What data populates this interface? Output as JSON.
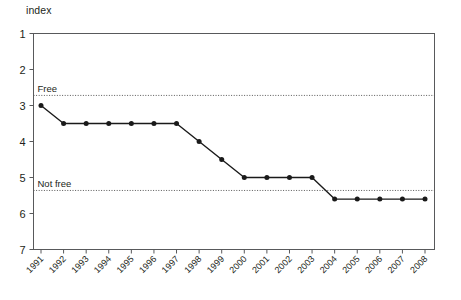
{
  "figure": {
    "axis_caption": "index"
  },
  "chart_data": {
    "type": "line",
    "title": "",
    "subtitle": "",
    "xlabel": "",
    "ylabel": "index",
    "grid": false,
    "legend_position": "none",
    "y_inverted": true,
    "ylim": [
      1,
      7
    ],
    "yticks": [
      1,
      2,
      3,
      4,
      5,
      6,
      7
    ],
    "ytick_labels": [
      "1",
      "2",
      "3",
      "4",
      "5",
      "6",
      "7"
    ],
    "x": [
      1991,
      1992,
      1993,
      1994,
      1995,
      1996,
      1997,
      1998,
      1999,
      2000,
      2001,
      2002,
      2003,
      2004,
      2005,
      2006,
      2007,
      2008
    ],
    "xtick_labels": [
      "1991",
      "1992",
      "1993",
      "1994",
      "1995",
      "1996",
      "1997",
      "1998",
      "1999",
      "2000",
      "2001",
      "2002",
      "2003",
      "2004",
      "2005",
      "2006",
      "2007",
      "2008"
    ],
    "series": [
      {
        "name": "index",
        "color": "#1a1a1a",
        "marker": "circle",
        "values": [
          3.0,
          3.5,
          3.5,
          3.5,
          3.5,
          3.5,
          3.5,
          4.0,
          4.5,
          5.0,
          5.0,
          5.0,
          5.0,
          5.6,
          5.6,
          5.6,
          5.6,
          5.6
        ]
      }
    ],
    "annotations": [
      {
        "label": "Free",
        "y": 2.72,
        "style": "dotted-threshold",
        "color": "#595959"
      },
      {
        "label": "Not free",
        "y": 5.36,
        "style": "dotted-threshold",
        "color": "#595959"
      }
    ]
  }
}
